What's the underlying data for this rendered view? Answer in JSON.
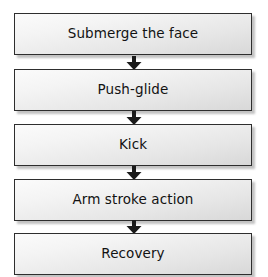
{
  "diagram": {
    "type": "vertical-flowchart",
    "orientation": "top-to-bottom",
    "background_color": "#ffffff",
    "box_border_color": "#2e2e2e",
    "box_fill_top_color": "#fbfbfb",
    "box_fill_bottom_color": "#d8d8d8",
    "text_color": "#121212",
    "arrow_color": "#1a1a1a",
    "step_count": 5,
    "connector_count": 4,
    "steps": [
      {
        "label": "Submerge the face"
      },
      {
        "label": "Push-glide"
      },
      {
        "label": "Kick"
      },
      {
        "label": "Arm stroke action"
      },
      {
        "label": "Recovery"
      }
    ],
    "connectors": [
      {
        "icon": "arrow-down-icon",
        "from": "Submerge the face",
        "to": "Push-glide"
      },
      {
        "icon": "arrow-down-icon",
        "from": "Push-glide",
        "to": "Kick"
      },
      {
        "icon": "arrow-down-icon",
        "from": "Kick",
        "to": "Arm stroke action"
      },
      {
        "icon": "arrow-down-icon",
        "from": "Arm stroke action",
        "to": "Recovery"
      }
    ]
  }
}
